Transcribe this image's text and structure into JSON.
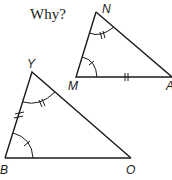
{
  "prompt": {
    "text": "Why?"
  },
  "triangles": [
    {
      "name": "NMA",
      "vertices": [
        {
          "label": "N",
          "x": 96,
          "y": 12
        },
        {
          "label": "M",
          "x": 76,
          "y": 77
        },
        {
          "label": "A",
          "x": 172,
          "y": 77
        }
      ],
      "marks": {
        "angle_N": "double-tick",
        "angle_M": "single-tick",
        "side_MA": "double-tick"
      }
    },
    {
      "name": "YBO",
      "vertices": [
        {
          "label": "Y",
          "x": 32,
          "y": 72
        },
        {
          "label": "B",
          "x": 5,
          "y": 158
        },
        {
          "label": "O",
          "x": 131,
          "y": 158
        }
      ],
      "marks": {
        "angle_Y": "double-tick",
        "angle_B": "single-tick",
        "side_YB": "double-tick"
      }
    }
  ],
  "labels": {
    "N": "N",
    "M": "M",
    "A": "A",
    "Y": "Y",
    "B": "B",
    "O": "O"
  }
}
